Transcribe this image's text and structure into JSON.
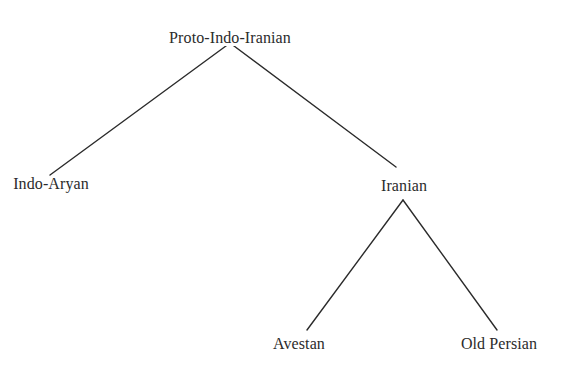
{
  "diagram": {
    "type": "tree",
    "background_color": "#ffffff",
    "edge_color": "#2b2b2b",
    "text_color": "#2b2b2b",
    "nodes": [
      {
        "id": "proto-indo-iranian",
        "label": "Proto-Indo-Iranian",
        "depth": 0,
        "x": 230,
        "y": 30
      },
      {
        "id": "indo-aryan",
        "label": "Indo-Aryan",
        "depth": 1,
        "x": 51,
        "y": 176
      },
      {
        "id": "iranian",
        "label": "Iranian",
        "depth": 1,
        "x": 404,
        "y": 178
      },
      {
        "id": "avestan",
        "label": "Avestan",
        "depth": 2,
        "x": 299,
        "y": 336
      },
      {
        "id": "old-persian",
        "label": "Old Persian",
        "depth": 2,
        "x": 499,
        "y": 336
      }
    ],
    "edges": [
      {
        "id": "edge-proto-to-indo-aryan",
        "from": "proto-indo-iranian",
        "to": "indo-aryan",
        "x1": 230,
        "y1": 43,
        "x2": 50,
        "y2": 175
      },
      {
        "id": "edge-proto-to-iranian",
        "from": "proto-indo-iranian",
        "to": "iranian",
        "x1": 230,
        "y1": 43,
        "x2": 396,
        "y2": 167
      },
      {
        "id": "edge-iranian-to-avestan",
        "from": "iranian",
        "to": "avestan",
        "x1": 403,
        "y1": 200,
        "x2": 307,
        "y2": 330
      },
      {
        "id": "edge-iranian-to-old-persian",
        "from": "iranian",
        "to": "old-persian",
        "x1": 403,
        "y1": 200,
        "x2": 497,
        "y2": 330
      }
    ]
  }
}
